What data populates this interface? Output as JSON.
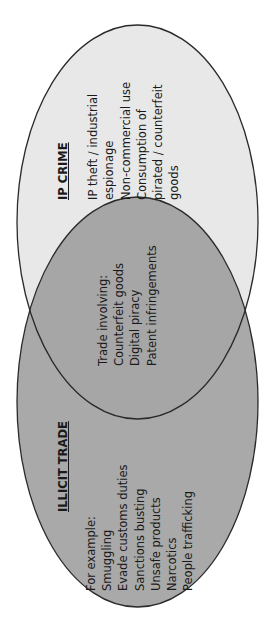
{
  "diagram": {
    "type": "venn",
    "orientation": "rotated-90-ccw",
    "colors": {
      "ip_crime_fill": "#e8e8e8",
      "illicit_trade_fill": "#a9a9a9",
      "overlap_fill": "#a6a6a6",
      "outline": "#2a2a2a",
      "text": "#1a1a1a"
    },
    "sets": [
      {
        "id": "ip_crime",
        "title": "IP CRIME",
        "items": [
          "IP theft / industrial",
          "espionage",
          "Non-commercial use",
          "Consumption of",
          "pirated / counterfeit",
          "goods"
        ]
      },
      {
        "id": "illicit_trade",
        "title": "ILLICIT TRADE",
        "items": [
          "For example:",
          "Smuggling",
          "Evade customs duties",
          "Sanctions busting",
          "Unsafe products",
          "Narcotics",
          "People trafficking"
        ]
      }
    ],
    "overlap": {
      "items": [
        "Trade involving:",
        "Counterfeit goods",
        "Digital piracy",
        "Patent infringements"
      ]
    }
  }
}
